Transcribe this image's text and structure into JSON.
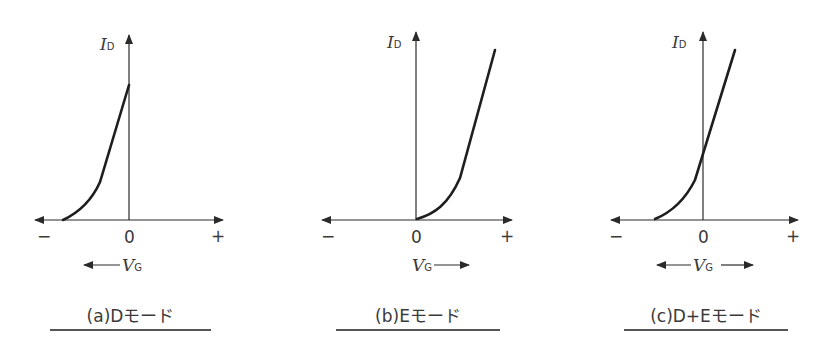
{
  "panels": [
    {
      "id": "a",
      "caption": "(a)Dモード",
      "y_label": "I",
      "y_label_sub": "D",
      "x_label": "V",
      "x_label_sub": "G",
      "tick_minus": "−",
      "tick_zero": "0",
      "tick_plus": "+",
      "vg_direction": "left"
    },
    {
      "id": "b",
      "caption": "(b)Eモード",
      "y_label": "I",
      "y_label_sub": "D",
      "x_label": "V",
      "x_label_sub": "G",
      "tick_minus": "−",
      "tick_zero": "0",
      "tick_plus": "+",
      "vg_direction": "right"
    },
    {
      "id": "c",
      "caption": "(c)D+Eモード",
      "y_label": "I",
      "y_label_sub": "D",
      "x_label": "V",
      "x_label_sub": "G",
      "tick_minus": "−",
      "tick_zero": "0",
      "tick_plus": "+",
      "vg_direction": "both"
    }
  ],
  "colors": {
    "line": "#2a2a2a",
    "text": "#3a3a3a"
  }
}
